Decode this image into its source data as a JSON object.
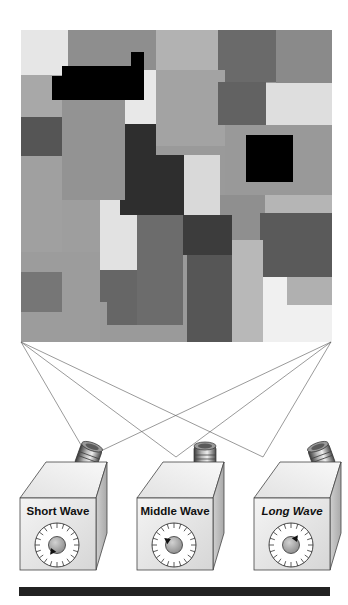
{
  "figure": {
    "type": "retinex-mondrian-diagram",
    "background": "#ffffff"
  },
  "mondrian": {
    "x": 21,
    "y": 30,
    "width": 311,
    "height": 312,
    "base_color": "#9a9a9a",
    "patches": [
      {
        "x": 21,
        "y": 30,
        "w": 47,
        "h": 45,
        "color": "#e6e6e6"
      },
      {
        "x": 68,
        "y": 30,
        "w": 88,
        "h": 64,
        "color": "#8e8e8e"
      },
      {
        "x": 156,
        "y": 30,
        "w": 62,
        "h": 40,
        "color": "#b2b2b2"
      },
      {
        "x": 218,
        "y": 30,
        "w": 58,
        "h": 52,
        "color": "#6a6a6a"
      },
      {
        "x": 276,
        "y": 30,
        "w": 56,
        "h": 53,
        "color": "#8a8a8a"
      },
      {
        "x": 21,
        "y": 75,
        "w": 45,
        "h": 42,
        "color": "#a8a8a8"
      },
      {
        "x": 156,
        "y": 70,
        "w": 69,
        "h": 76,
        "color": "#a3a3a3"
      },
      {
        "x": 218,
        "y": 82,
        "w": 48,
        "h": 43,
        "color": "#626262"
      },
      {
        "x": 266,
        "y": 83,
        "w": 66,
        "h": 42,
        "color": "#dedede"
      },
      {
        "x": 116,
        "y": 70,
        "w": 40,
        "h": 54,
        "color": "#e8e8e8"
      },
      {
        "x": 62,
        "y": 100,
        "w": 63,
        "h": 100,
        "color": "#939393"
      },
      {
        "x": 21,
        "y": 117,
        "w": 41,
        "h": 39,
        "color": "#555555"
      },
      {
        "x": 21,
        "y": 156,
        "w": 41,
        "h": 96,
        "color": "#a0a0a0"
      },
      {
        "x": 225,
        "y": 125,
        "w": 107,
        "h": 70,
        "color": "#999999"
      },
      {
        "x": 125,
        "y": 124,
        "w": 31,
        "h": 91,
        "color": "#2e2e2e"
      },
      {
        "x": 156,
        "y": 155,
        "w": 28,
        "h": 60,
        "color": "#2e2e2e"
      },
      {
        "x": 184,
        "y": 155,
        "w": 36,
        "h": 60,
        "color": "#d9d9d9"
      },
      {
        "x": 120,
        "y": 200,
        "w": 17,
        "h": 15,
        "color": "#2e2e2e"
      },
      {
        "x": 62,
        "y": 200,
        "w": 38,
        "h": 52,
        "color": "#9e9e9e"
      },
      {
        "x": 100,
        "y": 200,
        "w": 20,
        "h": 70,
        "color": "#e2e2e2"
      },
      {
        "x": 120,
        "y": 215,
        "w": 17,
        "h": 55,
        "color": "#e2e2e2"
      },
      {
        "x": 265,
        "y": 195,
        "w": 67,
        "h": 18,
        "color": "#b5b5b5"
      },
      {
        "x": 220,
        "y": 195,
        "w": 45,
        "h": 60,
        "color": "#8f8f8f"
      },
      {
        "x": 183,
        "y": 215,
        "w": 49,
        "h": 40,
        "color": "#3c3c3c"
      },
      {
        "x": 260,
        "y": 213,
        "w": 72,
        "h": 64,
        "color": "#5a5a5a"
      },
      {
        "x": 21,
        "y": 252,
        "w": 79,
        "h": 90,
        "color": "#9c9c9c"
      },
      {
        "x": 137,
        "y": 215,
        "w": 46,
        "h": 115,
        "color": "#6c6c6c"
      },
      {
        "x": 100,
        "y": 270,
        "w": 37,
        "h": 32,
        "color": "#666666"
      },
      {
        "x": 107,
        "y": 302,
        "w": 30,
        "h": 23,
        "color": "#666666"
      },
      {
        "x": 21,
        "y": 272,
        "w": 41,
        "h": 40,
        "color": "#767676"
      },
      {
        "x": 232,
        "y": 240,
        "w": 31,
        "h": 102,
        "color": "#b8b8b8"
      },
      {
        "x": 187,
        "y": 255,
        "w": 45,
        "h": 87,
        "color": "#565656"
      },
      {
        "x": 263,
        "y": 277,
        "w": 69,
        "h": 65,
        "color": "#f0f0f0"
      },
      {
        "x": 287,
        "y": 277,
        "w": 45,
        "h": 28,
        "color": "#b0b0b0"
      },
      {
        "x": 100,
        "y": 325,
        "w": 87,
        "h": 17,
        "color": "#9a9a9a"
      }
    ],
    "black_shapes": [
      {
        "points": "52,76 62,76 62,66 131,66 131,52 144,52 144,100 52,100",
        "color": "#000000"
      },
      {
        "points": "246,135 293,135 293,182 246,182",
        "color": "#000000"
      }
    ]
  },
  "sight_lines": {
    "color": "#555555",
    "origins": [
      [
        21,
        342
      ],
      [
        331,
        342
      ]
    ],
    "targets": [
      [
        88,
        457
      ],
      [
        176,
        457
      ],
      [
        263,
        457
      ]
    ]
  },
  "cameras": [
    {
      "id": "short",
      "label": "Short Wave",
      "italic": false,
      "dial_pointer_angle": 215,
      "offset_x": 0
    },
    {
      "id": "middle",
      "label": "Middle Wave",
      "italic": false,
      "dial_pointer_angle": 305,
      "offset_x": 117
    },
    {
      "id": "long",
      "label": "Long Wave",
      "italic": true,
      "dial_pointer_angle": 35,
      "offset_x": 234
    }
  ],
  "bottom_bar": {
    "x": 19,
    "y": 587,
    "width": 311,
    "height": 9,
    "color": "#222222"
  }
}
